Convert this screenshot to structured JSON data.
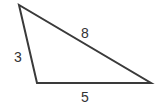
{
  "diagram": {
    "shape": "triangle",
    "vertices": [
      [
        19,
        5
      ],
      [
        37,
        83
      ],
      [
        151,
        83
      ]
    ],
    "stroke_color": "#3a3a3a",
    "sides": [
      {
        "name": "left",
        "label": "3"
      },
      {
        "name": "hypotenuse",
        "label": "8"
      },
      {
        "name": "bottom",
        "label": "5"
      }
    ]
  }
}
